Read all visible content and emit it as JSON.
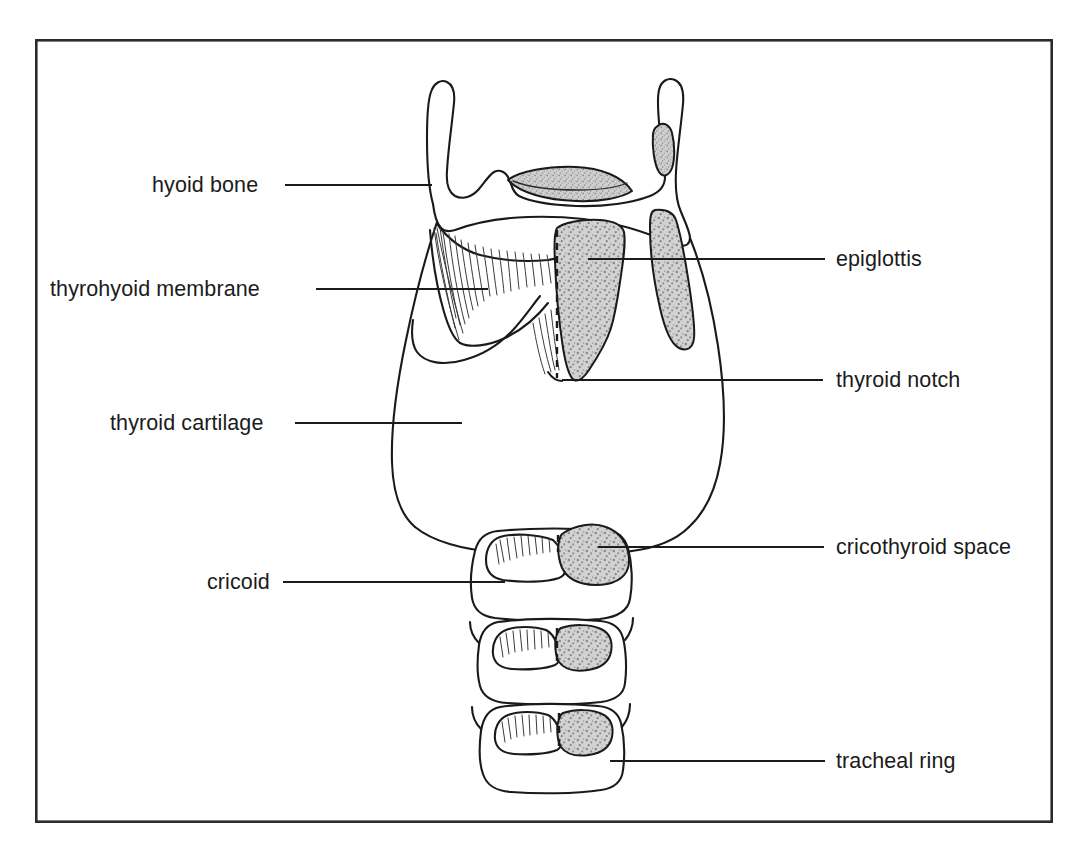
{
  "figure": {
    "frame": {
      "x": 35,
      "y": 39,
      "width": 1018,
      "height": 784,
      "border_color": "#2b2b2b",
      "background_color": "#ffffff"
    },
    "ink_color": "#1a1a1a",
    "shade_color": "#b8b8b8",
    "page_background": "#ffffff"
  },
  "labels": {
    "left": [
      {
        "id": "hyoid-bone",
        "text": "hyoid bone",
        "text_x": 152,
        "text_y": 192,
        "leader_x1": 285,
        "leader_x2": 432,
        "leader_y": 185
      },
      {
        "id": "thyrohyoid-membrane",
        "text": "thyrohyoid membrane",
        "text_x": 50,
        "text_y": 296,
        "leader_x1": 316,
        "leader_x2": 488,
        "leader_y": 289
      },
      {
        "id": "thyroid-cartilage",
        "text": "thyroid cartilage",
        "text_x": 110,
        "text_y": 430,
        "leader_x1": 295,
        "leader_x2": 462,
        "leader_y": 423
      },
      {
        "id": "cricoid",
        "text": "cricoid",
        "text_x": 207,
        "text_y": 589,
        "leader_x1": 283,
        "leader_x2": 505,
        "leader_y": 582
      }
    ],
    "right": [
      {
        "id": "epiglottis",
        "text": "epiglottis",
        "text_x": 836,
        "text_y": 266,
        "leader_x1": 588,
        "leader_x2": 825,
        "leader_y": 259
      },
      {
        "id": "thyroid-notch",
        "text": "thyroid notch",
        "text_x": 836,
        "text_y": 387,
        "leader_x1": 562,
        "leader_x2": 823,
        "leader_y": 380
      },
      {
        "id": "cricothyroid-space",
        "text": "cricothyroid space",
        "text_x": 836,
        "text_y": 554,
        "leader_x1": 598,
        "leader_x2": 824,
        "leader_y": 547
      },
      {
        "id": "tracheal-ring",
        "text": "tracheal ring",
        "text_x": 836,
        "text_y": 768,
        "leader_x1": 610,
        "leader_x2": 825,
        "leader_y": 761
      }
    ]
  },
  "structures": [
    {
      "id": "hyoid-bone",
      "name": "hyoid bone"
    },
    {
      "id": "thyrohyoid-membrane",
      "name": "thyrohyoid membrane"
    },
    {
      "id": "epiglottis",
      "name": "epiglottis"
    },
    {
      "id": "thyroid-cartilage",
      "name": "thyroid cartilage"
    },
    {
      "id": "thyroid-notch",
      "name": "thyroid notch"
    },
    {
      "id": "cricoid-cartilage",
      "name": "cricoid"
    },
    {
      "id": "cricothyroid-space",
      "name": "cricothyroid space"
    },
    {
      "id": "tracheal-ring-1",
      "name": "tracheal ring"
    },
    {
      "id": "tracheal-ring-2",
      "name": "tracheal ring"
    },
    {
      "id": "midline",
      "name": "midline"
    }
  ]
}
